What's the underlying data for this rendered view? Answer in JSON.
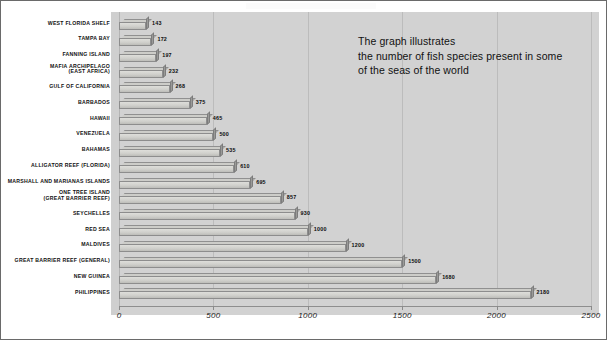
{
  "annotation": {
    "text": "The graph illustrates\nthe number of fish species present in some\nof the seas of the world"
  },
  "axis": {
    "ticks": [
      "0",
      "500",
      "1000",
      "1500",
      "2000",
      "2500"
    ],
    "tick_values": [
      0,
      500,
      1000,
      1500,
      2000,
      2500
    ]
  },
  "chart_data": {
    "type": "bar",
    "orientation": "horizontal",
    "title": "",
    "subtitle": "",
    "annotation": "The graph illustrates the number of fish species present in some of the seas of the world",
    "xlabel": "",
    "ylabel": "",
    "xlim": [
      0,
      2500
    ],
    "xticks": [
      0,
      500,
      1000,
      1500,
      2000,
      2500
    ],
    "grid": true,
    "grid_axis": "x",
    "legend": false,
    "style": "3d-horizontal-bar",
    "categories": [
      "WEST FLORIDA SHELF",
      "TAMPA BAY",
      "FANNING ISLAND",
      "MAFIA ARCHIPELAGO\n(EAST AFRICA)",
      "GULF OF CALIFORNIA",
      "BARBADOS",
      "HAWAII",
      "VENEZUELA",
      "BAHAMAS",
      "ALLIGATOR REEF (FLORIDA)",
      "MARSHALL AND MARIANAS ISLANDS",
      "ONE TREE ISLAND\n(GREAT BARRIER REEF)",
      "SEYCHELLES",
      "RED SEA",
      "MALDIVES",
      "GREAT BARRIER REEF (GENERAL)",
      "NEW GUINEA",
      "PHILIPPINES"
    ],
    "values": [
      143,
      172,
      197,
      232,
      268,
      375,
      465,
      500,
      535,
      610,
      695,
      857,
      930,
      1000,
      1200,
      1500,
      1680,
      2180
    ],
    "value_labels": [
      "143",
      "172",
      "197",
      "232",
      "268",
      "375",
      "465",
      "500",
      "535",
      "610",
      "695",
      "857",
      "930",
      "1000",
      "1200",
      "1500",
      "1680",
      "2180"
    ]
  },
  "colors": {
    "plot_background": "#d2d2d2",
    "page_background": "#ffffff",
    "bar_face": "#d0d0cc",
    "bar_top": "#cdcdc9",
    "bar_cap": "#9a9a98",
    "bar_outline": "#8d8d8d",
    "gridline": "#bcbcbc",
    "text": "#111111",
    "border": "#6a6a6a"
  }
}
